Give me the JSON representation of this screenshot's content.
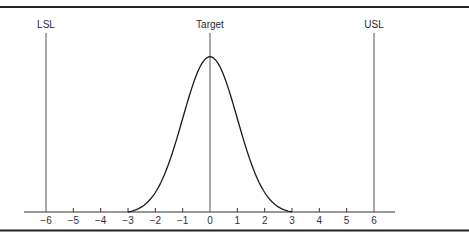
{
  "chart_data": {
    "type": "line",
    "title": "",
    "xlabel": "",
    "ylabel": "",
    "x_ticks": [
      -6,
      -5,
      -4,
      -3,
      -2,
      -1,
      0,
      1,
      2,
      3,
      4,
      5,
      6
    ],
    "xlim": [
      -6.8,
      6.8
    ],
    "grid": false,
    "series": [
      {
        "name": "Normal distribution",
        "mean": 0,
        "sigma": 1,
        "range": [
          -3,
          3
        ]
      }
    ],
    "annotations": [
      {
        "label": "LSL",
        "x": -6
      },
      {
        "label": "Target",
        "x": 0
      },
      {
        "label": "USL",
        "x": 6
      }
    ]
  },
  "labels": {
    "lsl": "LSL",
    "target": "Target",
    "usl": "USL"
  },
  "ticks": [
    "−6",
    "−5",
    "−4",
    "−3",
    "−2",
    "−1",
    "0",
    "1",
    "2",
    "3",
    "4",
    "5",
    "6"
  ],
  "colors": {
    "curve": "#1a1a1a",
    "lines": "#555555",
    "border": "#222222"
  }
}
